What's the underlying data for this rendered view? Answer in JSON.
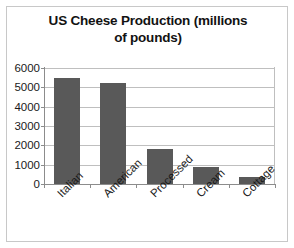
{
  "chart_data": {
    "type": "bar",
    "title": "US Cheese Production (millions of pounds)",
    "title_line1": "US Cheese Production (millions",
    "title_line2": "of pounds)",
    "categories": [
      "Italian",
      "American",
      "Processed",
      "Cream",
      "Cottage"
    ],
    "values": [
      5500,
      5200,
      1800,
      900,
      380
    ],
    "xlabel": "",
    "ylabel": "",
    "ylim": [
      0,
      6000
    ],
    "yticks": [
      6000,
      5000,
      4000,
      3000,
      2000,
      1000,
      0
    ],
    "ytick_labels": [
      "6000",
      "5000",
      "4000",
      "3000",
      "2000",
      "1000",
      "0"
    ],
    "grid": true,
    "legend": false,
    "bar_color": "#595959",
    "gridline_color": "#bfbfbf",
    "axis_color": "#8c8c8c"
  }
}
